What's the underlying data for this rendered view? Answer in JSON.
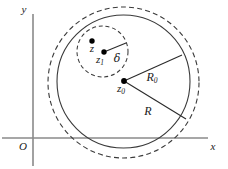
{
  "figure": {
    "background_color": "#ffffff",
    "stroke_color": "#3a3a3a",
    "axis_color": "#808080",
    "dot_color": "#000000"
  },
  "axes": {
    "x_label": "x",
    "y_label": "y",
    "origin_label": "O",
    "x_axis": {
      "y": 138,
      "x_start": 2,
      "x_end": 208
    },
    "y_axis": {
      "x": 33,
      "y_start": 14,
      "y_end": 166
    }
  },
  "points": [
    {
      "name": "z",
      "label": "z",
      "subscript": "",
      "cx": 92,
      "cy": 41,
      "r": 2.6
    },
    {
      "name": "z1",
      "label": "z",
      "subscript": "1",
      "cx": 104,
      "cy": 52,
      "r": 2.6
    },
    {
      "name": "z0",
      "label": "z",
      "subscript": "0",
      "cx": 124,
      "cy": 81,
      "r": 2.8
    }
  ],
  "circles": [
    {
      "name": "outer-dashed-circle",
      "style": "dashed",
      "cx": 123.5,
      "cy": 82.5,
      "r": 75.5,
      "radius_label": "R",
      "radius_subscript": ""
    },
    {
      "name": "outer-solid-circle",
      "style": "solid",
      "cx": 123.5,
      "cy": 81.5,
      "r": 66.5,
      "radius_label": "R",
      "radius_subscript": "0"
    },
    {
      "name": "inner-dashed-circle",
      "style": "dashed",
      "cx": 102.5,
      "cy": 51.5,
      "r": 25.5,
      "radius_label": "δ",
      "radius_subscript": ""
    }
  ],
  "radius_lines": [
    {
      "name": "delta-radius-line",
      "label": "δ",
      "from_x": 104,
      "from_y": 52,
      "to_x": 126,
      "to_y": 43,
      "label_x": 116,
      "label_y": 60
    },
    {
      "name": "R0-radius-line",
      "label": "R",
      "subscript": "0",
      "from_x": 124,
      "from_y": 81,
      "to_x": 182,
      "to_y": 55,
      "label_x": 151,
      "label_y": 80
    },
    {
      "name": "R-radius-line",
      "label": "R",
      "subscript": "",
      "from_x": 124,
      "from_y": 81,
      "to_x": 186,
      "to_y": 119,
      "label_x": 146,
      "label_y": 114
    }
  ]
}
